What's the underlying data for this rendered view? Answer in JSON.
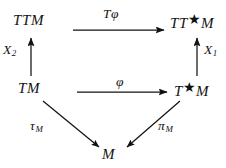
{
  "diagram": {
    "kind": "commutative-diagram",
    "background_color": "#ffffff",
    "ink_color": "#121212",
    "nodes": [
      {
        "id": "ttm",
        "label": "TTM",
        "position": "top-left",
        "x": 32,
        "y": 22
      },
      {
        "id": "ttsm",
        "label": "TT*M",
        "position": "top-right",
        "x": 193,
        "y": 22
      },
      {
        "id": "tm",
        "label": "TM",
        "position": "middle-left",
        "x": 33,
        "y": 90
      },
      {
        "id": "tsm",
        "label": "T*M",
        "position": "middle-right",
        "x": 192,
        "y": 90
      },
      {
        "id": "m",
        "label": "M",
        "position": "bottom-center",
        "x": 111,
        "y": 155
      }
    ],
    "arrows": [
      {
        "id": "tphi",
        "label": "Tφ",
        "label_plain": "T phi",
        "from": "tm",
        "to": "tsm",
        "direction": "right",
        "note": "top horizontal"
      },
      {
        "id": "phi",
        "label": "φ",
        "label_plain": "phi",
        "from": "tm",
        "to": "tsm",
        "direction": "right",
        "note": "middle horizontal"
      },
      {
        "id": "x2",
        "label": "X",
        "subscript": "2",
        "from": "tm",
        "to": "ttm",
        "direction": "up",
        "note": "left vertical"
      },
      {
        "id": "x1",
        "label": "X",
        "subscript": "1",
        "from": "tsm",
        "to": "ttsm",
        "direction": "up",
        "note": "right vertical"
      },
      {
        "id": "tau_m",
        "label": "τ",
        "subscript": "M",
        "from": "tm",
        "to": "m",
        "direction": "down-right",
        "note": "left diagonal"
      },
      {
        "id": "pi_m",
        "label": "π",
        "subscript": "M",
        "from": "tsm",
        "to": "m",
        "direction": "down-left",
        "note": "right diagonal"
      }
    ],
    "node_labels": {
      "ttm": "TTM",
      "ttsm_head": "TT",
      "ttsm_star": "★",
      "ttsm_tail": "M",
      "tm": "TM",
      "tsm_head": "T",
      "tsm_star": "★",
      "tsm_tail": "M",
      "m": "M"
    },
    "label_text": {
      "tphi_t": "T",
      "tphi_phi": "φ",
      "phi": "φ",
      "x_letter": "X",
      "x2_sub": "2",
      "x1_sub": "1",
      "tau": "τ",
      "pi": "π",
      "m_sub": "M"
    }
  }
}
